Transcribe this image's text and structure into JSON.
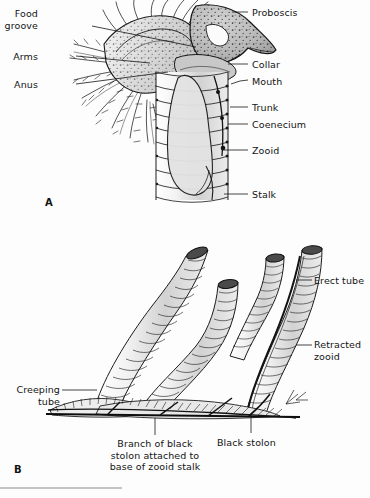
{
  "figure": {
    "background_color": "#fdfdfd",
    "ink_color": "#141414",
    "shade_color": "#b9b9b9",
    "panels": [
      {
        "id": "A",
        "letter": "A",
        "subject": "single zooid with proboscis, collar, arms and trunk within coenecium tube"
      },
      {
        "id": "B",
        "letter": "B",
        "subject": "colony of erect and creeping tubes joined by a black stolon"
      }
    ]
  },
  "panel_a": {
    "letter": "A",
    "labels": [
      {
        "name": "food-groove",
        "text": "Food\ngroove",
        "x": 38,
        "y": 8,
        "align": "right",
        "leader": [
          [
            92,
            26
          ],
          [
            196,
            47
          ]
        ]
      },
      {
        "name": "arms",
        "text": "Arms",
        "x": 38,
        "y": 51,
        "align": "right",
        "leader": [
          [
            76,
            56
          ],
          [
            150,
            63
          ]
        ]
      },
      {
        "name": "anus",
        "text": "Anus",
        "x": 38,
        "y": 79,
        "align": "right",
        "leader": [
          [
            76,
            84
          ],
          [
            168,
            72
          ]
        ]
      },
      {
        "name": "proboscis",
        "text": "Proboscis",
        "x": 252,
        "y": 7,
        "align": "left",
        "leader": [
          [
            232,
            12
          ],
          [
            248,
            12
          ]
        ]
      },
      {
        "name": "collar",
        "text": "Collar",
        "x": 252,
        "y": 59,
        "align": "left",
        "leader": [
          [
            228,
            64
          ],
          [
            248,
            64
          ]
        ]
      },
      {
        "name": "mouth",
        "text": "Mouth",
        "x": 252,
        "y": 76,
        "align": "left",
        "leader": [
          [
            232,
            84
          ],
          [
            248,
            80
          ]
        ]
      },
      {
        "name": "trunk",
        "text": "Trunk",
        "x": 252,
        "y": 102,
        "align": "left",
        "leader": [
          [
            230,
            107
          ],
          [
            248,
            107
          ]
        ]
      },
      {
        "name": "coenecium",
        "text": "Coenecium",
        "x": 252,
        "y": 119,
        "align": "left",
        "leader": [
          [
            228,
            124
          ],
          [
            248,
            124
          ]
        ]
      },
      {
        "name": "zooid",
        "text": "Zooid",
        "x": 252,
        "y": 145,
        "align": "left",
        "leader": [
          [
            222,
            150
          ],
          [
            248,
            150
          ]
        ]
      },
      {
        "name": "stalk",
        "text": "Stalk",
        "x": 252,
        "y": 189,
        "align": "left",
        "leader": [
          [
            224,
            194
          ],
          [
            248,
            194
          ]
        ]
      }
    ]
  },
  "panel_b": {
    "letter": "B",
    "labels": [
      {
        "name": "erect-tube",
        "text": "Erect tube",
        "x": 314,
        "y": 275,
        "align": "left",
        "leader": [
          [
            296,
            280
          ],
          [
            310,
            280
          ]
        ]
      },
      {
        "name": "retracted-zooid",
        "text": "Retracted\nzooid",
        "x": 314,
        "y": 339,
        "align": "left",
        "leader": [
          [
            296,
            345
          ],
          [
            310,
            345
          ]
        ]
      },
      {
        "name": "creeping-tube",
        "text": "Creeping\ntube",
        "x": 10,
        "y": 384,
        "align": "right",
        "leader": [
          [
            62,
            390
          ],
          [
            97,
            390
          ]
        ]
      },
      {
        "name": "black-stolon",
        "text": "Black stolon",
        "x": 245,
        "y": 437,
        "align": "left",
        "leader": [
          [
            251,
            414
          ],
          [
            251,
            433
          ]
        ]
      },
      {
        "name": "branch-of-black-stolon",
        "text": "Branch of black\nstolon attached to\nbase of zooid stalk",
        "x": 155,
        "y": 438,
        "align": "center",
        "leader": [
          [
            155,
            418
          ],
          [
            155,
            435
          ]
        ]
      }
    ]
  },
  "footer": {
    "rule_present": true
  }
}
